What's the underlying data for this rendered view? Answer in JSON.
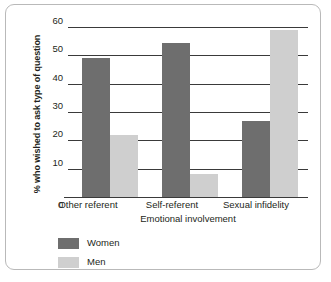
{
  "chart_data": {
    "type": "bar",
    "title": "",
    "xlabel": "Emotional involvement",
    "ylabel": "% who wished to ask type of question",
    "categories": [
      "Other referent",
      "Self-referent",
      "Sexual infidelity"
    ],
    "series": [
      {
        "name": "Women",
        "color": "#6e6e6e",
        "values": [
          49,
          54.5,
          27
        ]
      },
      {
        "name": "Men",
        "color": "#cfcfcf",
        "values": [
          22,
          8,
          59
        ]
      }
    ],
    "ylim": [
      0,
      60
    ],
    "yticks": [
      0,
      10,
      20,
      30,
      40,
      50,
      60
    ],
    "ytick_labels": [
      "0",
      "10",
      "20",
      "30",
      "40",
      "50",
      "60"
    ],
    "grid": true,
    "legend_position": "bottom-left"
  }
}
